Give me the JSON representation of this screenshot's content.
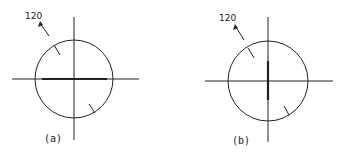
{
  "figure": {
    "colors": {
      "ink": "#222222",
      "background": "#ffffff"
    },
    "panels": [
      {
        "caption": "(a)",
        "annotation": "120",
        "heavy_axis": "horizontal"
      },
      {
        "caption": "(b)",
        "annotation": "120",
        "heavy_axis": "vertical"
      }
    ]
  }
}
